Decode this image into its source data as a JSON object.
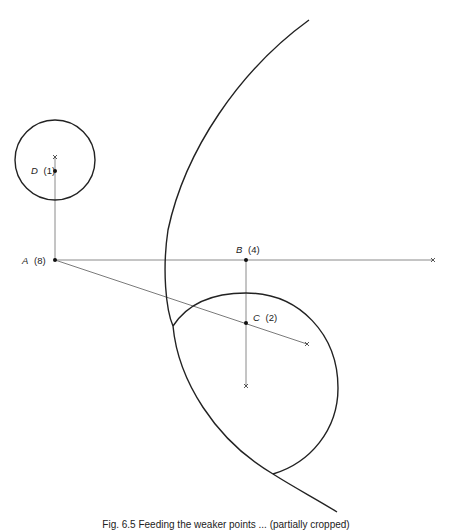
{
  "figure": {
    "type": "geometric-construction",
    "points": [
      {
        "id": "A",
        "weight": "(8)"
      },
      {
        "id": "B",
        "weight": "(4)"
      },
      {
        "id": "C",
        "weight": "(2)"
      },
      {
        "id": "D",
        "weight": "(1)"
      }
    ],
    "caption": "Fig. 6.5  Feeding the weaker points ... (partially cropped)"
  },
  "colors": {
    "ink": "#222222",
    "construction_line": "#8a8a8a",
    "background": "#ffffff"
  }
}
